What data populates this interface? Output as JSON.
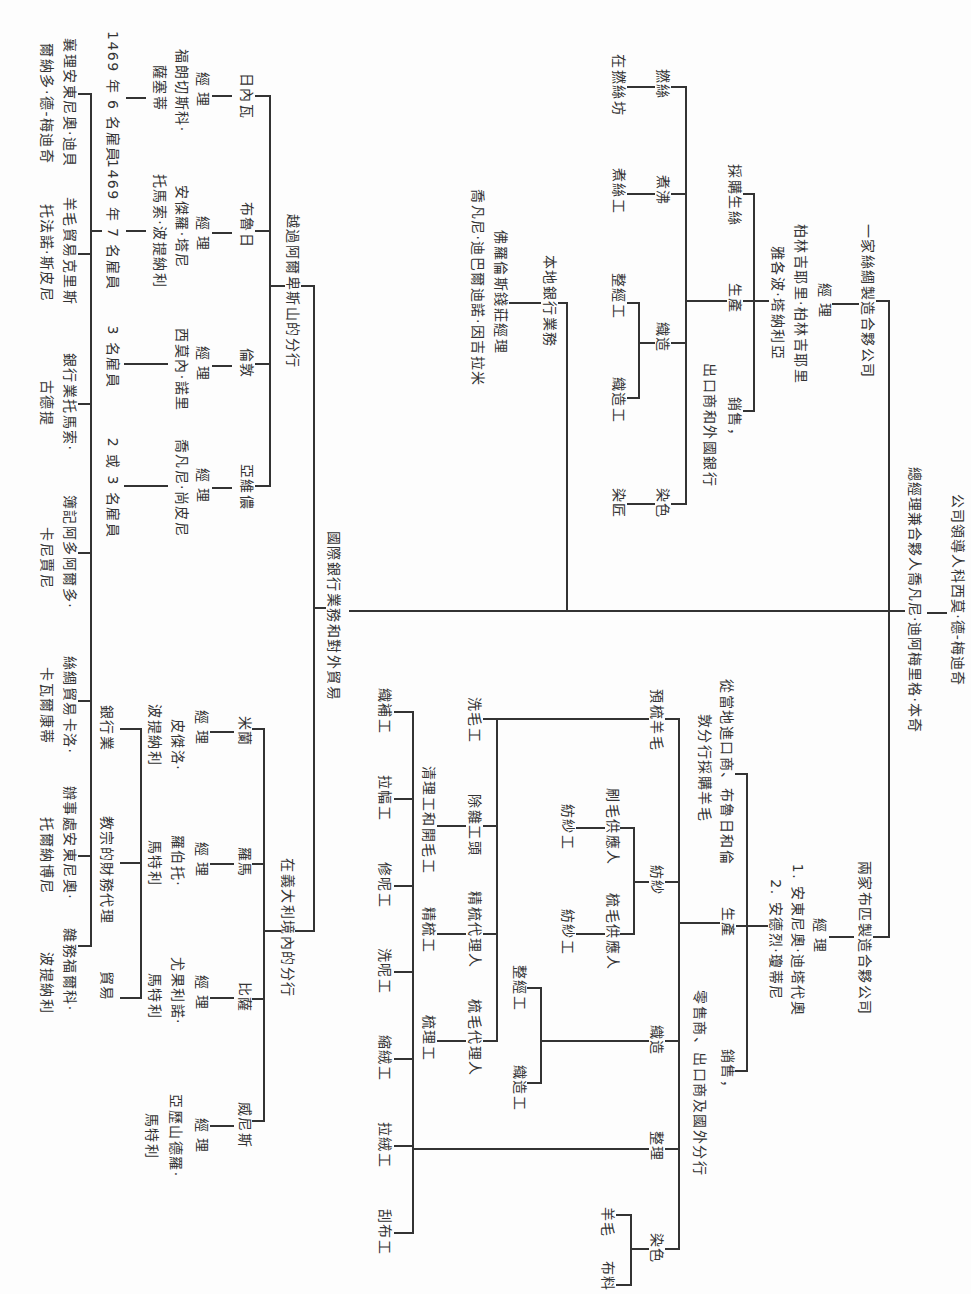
{
  "header": {
    "leader": "公司領導人科西莫·德-梅迪奇",
    "general_manager": "總經理兼合夥人喬凡尼·迪阿梅里格·本奇"
  },
  "silk": {
    "title": "一家絲綢製造合夥公司",
    "manager_label": "經理",
    "managers": [
      "柏林吉耶里·柏林吉耶里",
      "雅各波·塔納利亞"
    ],
    "functions": {
      "purchase": "採購生絲",
      "production": "生產",
      "sales": [
        "銷售，",
        "出口商和外國銀行"
      ]
    },
    "production_steps": [
      {
        "label": "撚絲",
        "workers": [
          "在撚絲坊"
        ]
      },
      {
        "label": "煮沸",
        "workers": [
          "煮絲工"
        ]
      },
      {
        "label": "織造",
        "workers": [
          "整經工",
          "織造工"
        ]
      },
      {
        "label": "染色",
        "workers": [
          "染匠"
        ]
      }
    ]
  },
  "local_banking": {
    "title": "本地銀行業務",
    "manager_title": "佛羅倫斯錢莊經理",
    "manager_name": "喬凡尼·迪巴爾迪諾·因吉拉米"
  },
  "international": {
    "title": "國際銀行業務和對外貿易",
    "beyond_alps": {
      "title": "越過阿爾卑斯山的分行",
      "branches": [
        {
          "city": "日內瓦",
          "manager_label": "經理",
          "manager": [
            "福朗切斯科·",
            "薩塞蒂"
          ],
          "staff": "1469 年 6 名雇員"
        },
        {
          "city": "布魯日",
          "manager_label": "經理",
          "manager": [
            "安傑羅·塔尼",
            "托馬索·波提納利"
          ],
          "staff": "1469 年 7 名雇員"
        },
        {
          "city": "倫敦",
          "manager_label": "經理",
          "manager": [
            "西莫內·諾里"
          ],
          "staff": "3 名雇員"
        },
        {
          "city": "亞維儂",
          "manager_label": "經理",
          "manager": [
            "喬凡尼·尚皮尼"
          ],
          "staff": "2 或 3 名雇員"
        }
      ]
    },
    "italy": {
      "title": "在義大利境內的分行",
      "branches": [
        {
          "city": "米蘭",
          "manager_label": "經理",
          "manager": [
            "皮傑洛·",
            "波提納利"
          ],
          "activity": "銀行業"
        },
        {
          "city": "羅馬",
          "manager_label": "經理",
          "manager": [
            "羅伯托·",
            "馬特利"
          ],
          "activity": "教宗的財務代理"
        },
        {
          "city": "比薩",
          "manager_label": "經理",
          "manager": [
            "尤果利諾·",
            "馬特利"
          ],
          "activity": "貿易"
        },
        {
          "city": "威尼斯",
          "manager_label": "經理",
          "manager": [
            "亞歷山德羅·",
            "馬特利"
          ]
        }
      ]
    }
  },
  "staff_row": [
    {
      "lines": [
        "襄理安東尼奧·迪貝",
        "爾納多·德-梅迪奇"
      ]
    },
    {
      "lines": [
        "羊毛貿易克里斯",
        "托法諾·斯皮尼"
      ]
    },
    {
      "lines": [
        "銀行業托馬索·",
        "古德提"
      ]
    },
    {
      "lines": [
        "簿記阿多阿爾多·",
        "卡尼賈尼"
      ]
    },
    {
      "lines": [
        "絲綢貿易卡洛·",
        "卡瓦爾康蒂"
      ]
    },
    {
      "lines": [
        "辦事處安東尼奧·",
        "托爾納博尼"
      ]
    },
    {
      "lines": [
        "雜務福爾科·",
        "波提納利"
      ]
    }
  ],
  "wool": {
    "title": "兩家布匹製造合夥公司",
    "manager_label": "經理",
    "managers": [
      "1. 安東尼奧·迪塔代奧",
      "2. 安德烈·瓊蒂尼"
    ],
    "functions": {
      "purchase": [
        "從當地進口商、布魯日和倫",
        "敦分行採購羊毛"
      ],
      "production": "生產",
      "sales": [
        "銷售，",
        "零售商、出口商及國外分行"
      ]
    },
    "production_steps": [
      {
        "label": "預梳羊毛",
        "sub": [
          {
            "label": "洗毛工"
          },
          {
            "label": "除雜工頭",
            "workers": [
              "清理工和開毛工"
            ]
          },
          {
            "label": "精梳代理人",
            "workers": [
              "精梳工"
            ]
          },
          {
            "label": "梳毛代理人",
            "workers": [
              "梳理工"
            ]
          }
        ]
      },
      {
        "label": "紡紗",
        "sub": [
          {
            "label": "刷毛供應人",
            "workers": [
              "紡紗工"
            ]
          },
          {
            "label": "梳毛供應人",
            "workers": [
              "紡紗工"
            ]
          }
        ]
      },
      {
        "label": "織造",
        "workers": [
          "整經工",
          "織造工"
        ]
      },
      {
        "label": "整理",
        "workers": [
          "織補工",
          "拉幅工",
          "修呢工",
          "洗呢工",
          "縮絨工",
          "拉絨工",
          "刮布工"
        ]
      },
      {
        "label": "染色",
        "workers": [
          "羊毛",
          "布料"
        ]
      }
    ]
  },
  "style": {
    "ink": "#333333",
    "paper": "#fdfdfd"
  }
}
